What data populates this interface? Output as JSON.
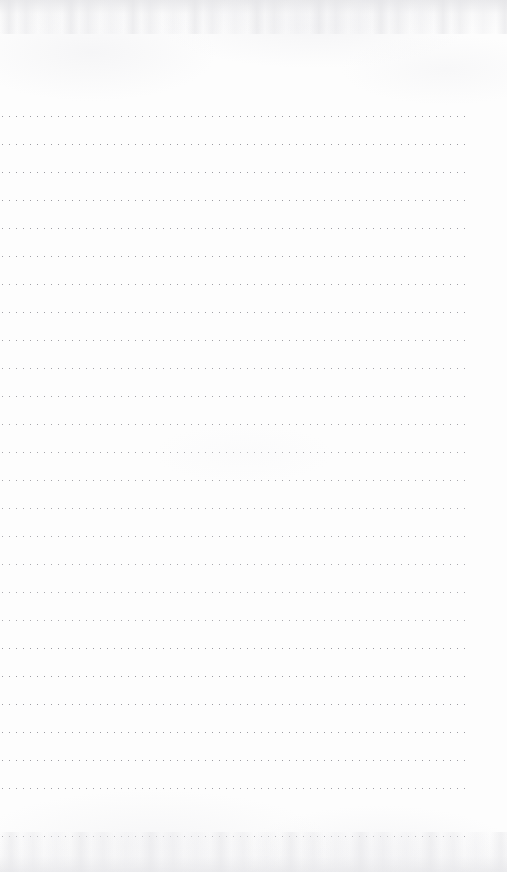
{
  "document": {
    "kind": "scanned-dotted-ruled-notebook-page",
    "page_width": 507,
    "page_height": 872,
    "paper_color": "#fdfdfd",
    "has_visible_text": false,
    "has_handwriting": false,
    "content_text": ""
  },
  "ruling": {
    "style": "dotted",
    "dot_color": "#9a9aa0",
    "dot_size_px": 1.3,
    "dot_pitch_px": 7,
    "line_count": 26,
    "line_spacing_px": 28,
    "first_line_y": 116,
    "last_line_y": 836,
    "line_start_x": 2,
    "line_end_x": 470,
    "line_length_px": 468,
    "lines": [
      {
        "index": 1,
        "y": 116,
        "x_start": 2,
        "x_end": 470
      },
      {
        "index": 2,
        "y": 144,
        "x_start": 2,
        "x_end": 470
      },
      {
        "index": 3,
        "y": 172,
        "x_start": 2,
        "x_end": 470
      },
      {
        "index": 4,
        "y": 200,
        "x_start": 2,
        "x_end": 470
      },
      {
        "index": 5,
        "y": 228,
        "x_start": 2,
        "x_end": 470
      },
      {
        "index": 6,
        "y": 256,
        "x_start": 2,
        "x_end": 470
      },
      {
        "index": 7,
        "y": 284,
        "x_start": 2,
        "x_end": 470
      },
      {
        "index": 8,
        "y": 312,
        "x_start": 2,
        "x_end": 470
      },
      {
        "index": 9,
        "y": 340,
        "x_start": 2,
        "x_end": 470
      },
      {
        "index": 10,
        "y": 368,
        "x_start": 2,
        "x_end": 470
      },
      {
        "index": 11,
        "y": 396,
        "x_start": 2,
        "x_end": 470
      },
      {
        "index": 12,
        "y": 424,
        "x_start": 2,
        "x_end": 470
      },
      {
        "index": 13,
        "y": 452,
        "x_start": 2,
        "x_end": 470
      },
      {
        "index": 14,
        "y": 480,
        "x_start": 2,
        "x_end": 470
      },
      {
        "index": 15,
        "y": 508,
        "x_start": 2,
        "x_end": 470
      },
      {
        "index": 16,
        "y": 536,
        "x_start": 2,
        "x_end": 470
      },
      {
        "index": 17,
        "y": 564,
        "x_start": 2,
        "x_end": 470
      },
      {
        "index": 18,
        "y": 592,
        "x_start": 2,
        "x_end": 470
      },
      {
        "index": 19,
        "y": 620,
        "x_start": 2,
        "x_end": 470
      },
      {
        "index": 20,
        "y": 648,
        "x_start": 2,
        "x_end": 470
      },
      {
        "index": 21,
        "y": 676,
        "x_start": 2,
        "x_end": 470
      },
      {
        "index": 22,
        "y": 704,
        "x_start": 2,
        "x_end": 470
      },
      {
        "index": 23,
        "y": 732,
        "x_start": 2,
        "x_end": 470
      },
      {
        "index": 24,
        "y": 760,
        "x_start": 2,
        "x_end": 470
      },
      {
        "index": 25,
        "y": 788,
        "x_start": 2,
        "x_end": 470
      },
      {
        "index": 26,
        "y": 836,
        "x_start": 2,
        "x_end": 470
      }
    ]
  },
  "margins": {
    "top_blank_height": 116,
    "bottom_blank_height": 36,
    "right_blank_width": 37
  }
}
